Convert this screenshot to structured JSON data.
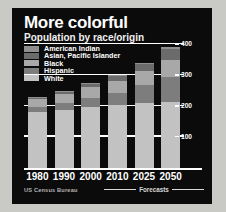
{
  "chart_data": {
    "type": "bar",
    "title": "More colorful",
    "subtitle": "Population by race/origin",
    "xlabel": "",
    "ylabel": "",
    "ylim": [
      0,
      420
    ],
    "grid": true,
    "legend_position": "top-left",
    "stacked": true,
    "categories": [
      "1980",
      "1990",
      "2000",
      "2010",
      "2025",
      "2050"
    ],
    "yticks": [
      100,
      200,
      300,
      400
    ],
    "ytick_labels": [
      "100",
      "200",
      "300",
      "400"
    ],
    "series": [
      {
        "name": "White",
        "color": "#c2c2c2",
        "values": [
          181,
          188,
          196,
          202,
          209,
          213
        ]
      },
      {
        "name": "Hispanic",
        "color": "#7d7d7d",
        "values": [
          15,
          22,
          31,
          41,
          59,
          81
        ]
      },
      {
        "name": "Black",
        "color": "#a8a8a8",
        "values": [
          27,
          30,
          34,
          38,
          44,
          54
        ]
      },
      {
        "name": "Asian, Pacific Islander",
        "color": "#6b6b6b",
        "values": [
          4,
          7,
          11,
          15,
          23,
          38
        ]
      },
      {
        "name": "American Indian",
        "color": "#8f8f8f",
        "values": [
          2,
          2,
          2,
          3,
          3,
          4
        ]
      }
    ],
    "annotations": [
      {
        "text": "Forecasts",
        "covers": [
          "2025",
          "2050"
        ]
      }
    ],
    "source": "US Census Bureau"
  },
  "legend": {
    "items": [
      {
        "label": "American Indian",
        "color": "#8f8f8f"
      },
      {
        "label": "Asian, Pacific Islander",
        "color": "#6b6b6b"
      },
      {
        "label": "Black",
        "color": "#a8a8a8"
      },
      {
        "label": "Hispanic",
        "color": "#7d7d7d"
      },
      {
        "label": "White",
        "color": "#c2c2c2"
      }
    ]
  },
  "footer": {
    "source": "US Census Bureau",
    "forecast_label": "Forecasts"
  },
  "colors": {
    "panel_background": "#0b0b0b",
    "page_background": "#c9c9c6",
    "gridline": "#ffffff",
    "text": "#ffffff"
  }
}
